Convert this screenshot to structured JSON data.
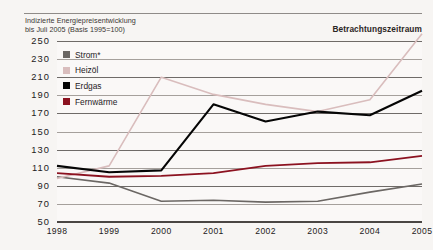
{
  "title": {
    "line1": "Indizierte Energiepreisentwicklung",
    "line2": "bis Juli 2005 (Basis 1995=100)"
  },
  "period_label": "Betrachtungszeitraum",
  "legend": {
    "items": [
      {
        "label": "Strom*",
        "color": "#6b6764",
        "key": "strom"
      },
      {
        "label": "Heizöl",
        "color": "#d9bdbd",
        "key": "heizoel"
      },
      {
        "label": "Erdgas",
        "color": "#050505",
        "key": "erdgas"
      },
      {
        "label": "Fernwärme",
        "color": "#8c1220",
        "key": "fernwaerme"
      }
    ]
  },
  "chart_data": {
    "type": "line",
    "title": "Indizierte Energiepreisentwicklung bis Juli 2005 (Basis 1995=100)",
    "xlabel": "",
    "ylabel": "",
    "grid": true,
    "legend_position": "inside-top-left",
    "categories": [
      "1998",
      "1999",
      "2000",
      "2001",
      "2002",
      "2003",
      "2004",
      "2005"
    ],
    "x": [
      1998,
      1999,
      2000,
      2001,
      2002,
      2003,
      2004,
      2005
    ],
    "xlim": [
      1998,
      2005
    ],
    "ylim": [
      50,
      250
    ],
    "yticks": [
      50,
      70,
      90,
      110,
      130,
      150,
      170,
      190,
      210,
      230,
      250
    ],
    "xticks": [
      "1998",
      "1999",
      "2000",
      "2001",
      "2002",
      "2003",
      "2004",
      "2005"
    ],
    "series": [
      {
        "name": "Strom*",
        "color": "#6b6764",
        "values": [
          100,
          93,
          73,
          74,
          72,
          73,
          83,
          92
        ]
      },
      {
        "name": "Heizöl",
        "color": "#d9bdbd",
        "values": [
          98,
          112,
          210,
          191,
          180,
          172,
          185,
          258
        ]
      },
      {
        "name": "Erdgas",
        "color": "#050505",
        "values": [
          112,
          105,
          107,
          180,
          161,
          172,
          168,
          195
        ]
      },
      {
        "name": "Fernwärme",
        "color": "#8c1220",
        "values": [
          104,
          100,
          101,
          104,
          112,
          115,
          116,
          123
        ]
      }
    ]
  }
}
